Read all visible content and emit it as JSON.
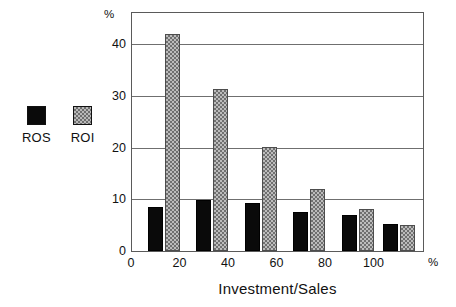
{
  "chart_data": {
    "type": "bar",
    "title": "",
    "xlabel": "Investment/Sales",
    "ylabel": "%",
    "x_unit": "%",
    "y_unit": "%",
    "categories": [
      "0-20",
      "20-40",
      "40-60",
      "60-80",
      "80-100",
      "100+"
    ],
    "x_group_centers": [
      13,
      33,
      53,
      73,
      93,
      110
    ],
    "series": [
      {
        "name": "ROS",
        "color": "#0a0a0a",
        "values": [
          8.5,
          9.8,
          9.3,
          7.5,
          7.0,
          5.3
        ]
      },
      {
        "name": "ROI",
        "color": "#bcbcbc",
        "values": [
          42.0,
          31.3,
          20.2,
          12.0,
          8.1,
          5.0
        ]
      }
    ],
    "xlim": [
      0,
      120
    ],
    "ylim": [
      0,
      46
    ],
    "xticks": [
      0,
      20,
      40,
      60,
      80,
      100
    ],
    "yticks": [
      0,
      10,
      20,
      30,
      40
    ],
    "grid": "horizontal",
    "legend_position": "left-outside"
  },
  "legend": {
    "entries": [
      {
        "label": "ROS",
        "swatch": "solid-black-square"
      },
      {
        "label": "ROI",
        "swatch": "gray-checkered-square"
      }
    ]
  },
  "axes": {
    "y_unit_label": "%",
    "x_unit_label": "%",
    "y_tick_labels": [
      "0",
      "10",
      "20",
      "30",
      "40"
    ],
    "x_tick_labels": [
      "0",
      "20",
      "40",
      "60",
      "80",
      "100"
    ],
    "x_axis_title": "Investment/Sales"
  }
}
